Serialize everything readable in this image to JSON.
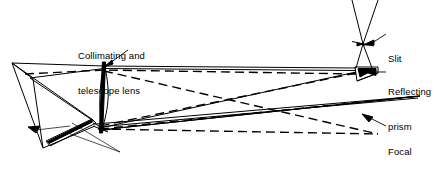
{
  "figure": {
    "background_color": "#ffffff",
    "line_color": "#000000",
    "width": 436,
    "height": 175
  },
  "labels": [
    {
      "id": "collimating-telescope-lens",
      "line1": "Collimating and",
      "line2": "telescope lens",
      "x": 78,
      "y": 27
    },
    {
      "id": "slit",
      "line1": "Slit",
      "line2": "",
      "x": 388,
      "y": 30
    },
    {
      "id": "reflecting-prism",
      "line1": "Reflecting",
      "line2": "prism",
      "x": 388,
      "y": 63
    },
    {
      "id": "focal-plane",
      "line1": "Focal",
      "line2": "plane",
      "x": 388,
      "y": 123
    },
    {
      "id": "reflecting-surface",
      "line1": "Reflecting surface",
      "line2": "",
      "x": 68,
      "y": 156
    }
  ],
  "components": [
    {
      "id": "slit",
      "name": "Slit",
      "type": "aperture"
    },
    {
      "id": "reflecting-prism",
      "name": "Reflecting prism",
      "type": "prism"
    },
    {
      "id": "collimating-telescope-lens",
      "name": "Collimating and telescope lens",
      "type": "lens"
    },
    {
      "id": "reflecting-surface",
      "name": "Reflecting surface",
      "type": "mirror"
    },
    {
      "id": "focal-plane",
      "name": "Focal plane",
      "type": "image-plane"
    }
  ],
  "geometry": {
    "lens": {
      "top_x": 103,
      "top_y": 65,
      "bottom_x": 100,
      "bottom_y": 131,
      "bulge": 7
    },
    "slit": {
      "center_x": 363,
      "center_y": 44,
      "bar_left_x": 353,
      "bar_right_x": 373
    },
    "prism": {
      "top_left_x": 355,
      "top_left_y": 67,
      "top_right_x": 377,
      "top_right_y": 67,
      "bottom_x": 357,
      "bottom_y": 80
    },
    "mirror_wedge": {
      "apex_x": 11,
      "apex_y": 63,
      "lower_x": 43,
      "lower_y": 148,
      "mid_x": 32,
      "mid_y": 78
    },
    "focal_plane": {
      "right_x": 420,
      "right_y": 96,
      "left_x": 118,
      "left_y": 128
    }
  },
  "rays": {
    "solid_count": 12,
    "dashed_count": 4,
    "style_solid": "solid",
    "style_dashed": "dashed"
  }
}
